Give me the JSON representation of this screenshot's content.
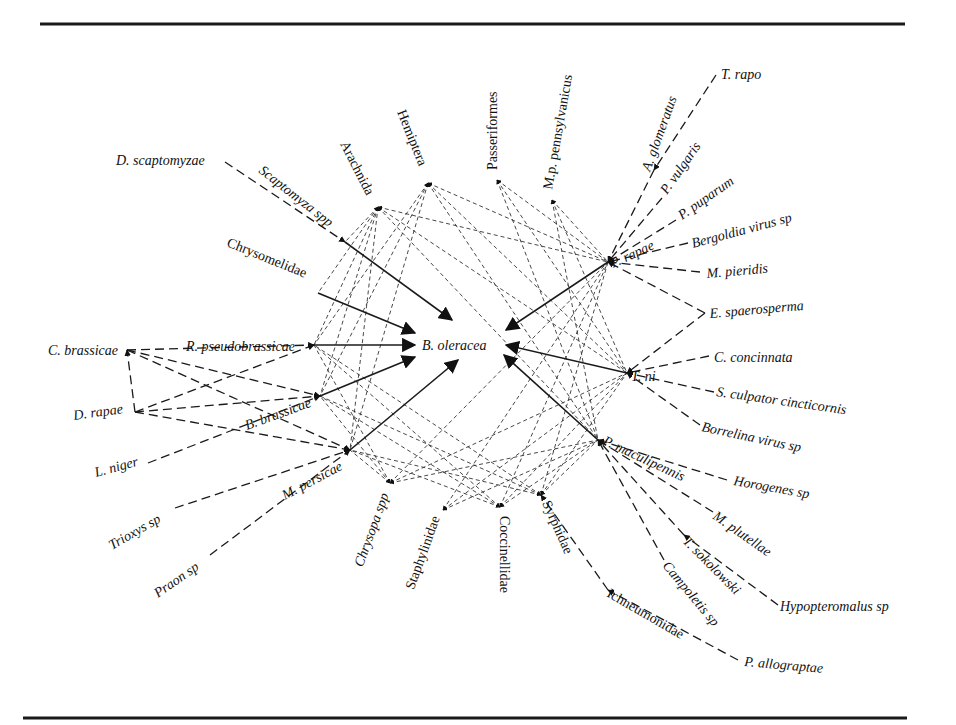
{
  "figure": {
    "center_node": "B. oleracea",
    "rules": {
      "top": {
        "x1": 40,
        "x2": 905,
        "y": 24
      },
      "bottom": {
        "x1": 23,
        "x2": 907,
        "y": 718
      }
    }
  },
  "nodes": [
    {
      "id": "boleracea",
      "label": "B. oleracea",
      "x": 450,
      "y": 345,
      "lx": 422,
      "ly": 350,
      "rot": 0,
      "italic": true,
      "anchor": "start"
    },
    {
      "id": "scapto",
      "label": "Scaptomyza spp",
      "x": 345,
      "y": 242,
      "lx": 258,
      "ly": 172,
      "rot": 38,
      "italic": true,
      "anchor": "start"
    },
    {
      "id": "chryso",
      "label": "Chrysomelidae",
      "x": 318,
      "y": 293,
      "lx": 226,
      "ly": 246,
      "rot": 22,
      "italic": false,
      "anchor": "start"
    },
    {
      "id": "rpseudo",
      "label": "R. pseudobrassicae",
      "x": 314,
      "y": 345,
      "lx": 186,
      "ly": 351,
      "rot": 0,
      "italic": true,
      "anchor": "start"
    },
    {
      "id": "bbrass",
      "label": "B. brassicae",
      "x": 320,
      "y": 396,
      "lx": 247,
      "ly": 430,
      "rot": -20,
      "italic": true,
      "anchor": "start"
    },
    {
      "id": "mpers",
      "label": "M. persicae",
      "x": 350,
      "y": 450,
      "lx": 285,
      "ly": 500,
      "rot": -28,
      "italic": true,
      "anchor": "start"
    },
    {
      "id": "prapae",
      "label": "P. rapae",
      "x": 608,
      "y": 262,
      "lx": 613,
      "ly": 268,
      "rot": -25,
      "italic": true,
      "anchor": "start"
    },
    {
      "id": "tni",
      "label": "T. ni",
      "x": 627,
      "y": 373,
      "lx": 631,
      "ly": 381,
      "rot": 0,
      "italic": true,
      "anchor": "start"
    },
    {
      "id": "pmacu",
      "label": "P. maculipennis",
      "x": 598,
      "y": 440,
      "lx": 602,
      "ly": 444,
      "rot": 25,
      "italic": true,
      "anchor": "start"
    },
    {
      "id": "arach",
      "label": "Arachnida",
      "x": 378,
      "y": 207,
      "lx": 340,
      "ly": 144,
      "rot": 63,
      "italic": false,
      "anchor": "start"
    },
    {
      "id": "hemip",
      "label": "Hemiptera",
      "x": 428,
      "y": 183,
      "lx": 397,
      "ly": 112,
      "rot": 68,
      "italic": false,
      "anchor": "start"
    },
    {
      "id": "passer",
      "label": "Passeriformes",
      "x": 497,
      "y": 180,
      "lx": 497,
      "ly": 170,
      "rot": -90,
      "italic": false,
      "anchor": "start"
    },
    {
      "id": "mpp",
      "label": "M.p. pennsylvanicus",
      "x": 552,
      "y": 200,
      "lx": 552,
      "ly": 190,
      "rot": -80,
      "italic": false,
      "anchor": "start"
    },
    {
      "id": "chrysopa",
      "label": "Chrysopa spp",
      "x": 390,
      "y": 483,
      "lx": 389,
      "ly": 495,
      "rot": -70,
      "italic": true,
      "anchor": "end"
    },
    {
      "id": "staph",
      "label": "Staphylinidae",
      "x": 443,
      "y": 510,
      "lx": 440,
      "ly": 518,
      "rot": -70,
      "italic": false,
      "anchor": "end"
    },
    {
      "id": "cocci",
      "label": "Coccinellidae",
      "x": 500,
      "y": 507,
      "lx": 500,
      "ly": 516,
      "rot": 90,
      "italic": false,
      "anchor": "start"
    },
    {
      "id": "syrph",
      "label": "Syrphidae",
      "x": 541,
      "y": 495,
      "lx": 542,
      "ly": 503,
      "rot": 66,
      "italic": false,
      "anchor": "start"
    },
    {
      "id": "dscapto",
      "label": "D. scaptomyzae",
      "x": 225,
      "y": 162,
      "lx": 116,
      "ly": 165,
      "rot": 0,
      "italic": true,
      "anchor": "start"
    },
    {
      "id": "cbrass",
      "label": "C. brassicae",
      "x": 127,
      "y": 350,
      "lx": 48,
      "ly": 355,
      "rot": 0,
      "italic": true,
      "anchor": "start"
    },
    {
      "id": "drapae",
      "label": "D. rapae",
      "x": 135,
      "y": 412,
      "lx": 74,
      "ly": 420,
      "rot": -8,
      "italic": true,
      "anchor": "start"
    },
    {
      "id": "lniger",
      "label": "L. niger",
      "x": 148,
      "y": 463,
      "lx": 96,
      "ly": 477,
      "rot": -15,
      "italic": true,
      "anchor": "start"
    },
    {
      "id": "trioxys",
      "label": "Trioxys sp",
      "x": 175,
      "y": 508,
      "lx": 112,
      "ly": 550,
      "rot": -30,
      "italic": true,
      "anchor": "start"
    },
    {
      "id": "praon",
      "label": "Praon sp",
      "x": 210,
      "y": 555,
      "lx": 158,
      "ly": 598,
      "rot": -35,
      "italic": true,
      "anchor": "start"
    },
    {
      "id": "aglom",
      "label": "A. glomeratus",
      "x": 654,
      "y": 170,
      "lx": 650,
      "ly": 172,
      "rot": -70,
      "italic": true,
      "anchor": "start"
    },
    {
      "id": "trapo",
      "label": "T. rapo",
      "x": 716,
      "y": 75,
      "lx": 721,
      "ly": 79,
      "rot": 0,
      "italic": true,
      "anchor": "start"
    },
    {
      "id": "pvulg",
      "label": "P. vulgaris",
      "x": 662,
      "y": 198,
      "lx": 667,
      "ly": 195,
      "rot": -55,
      "italic": true,
      "anchor": "start"
    },
    {
      "id": "ppup",
      "label": "P. puparum",
      "x": 676,
      "y": 220,
      "lx": 682,
      "ly": 220,
      "rot": -35,
      "italic": true,
      "anchor": "start"
    },
    {
      "id": "bergol",
      "label": "Bergoldia virus sp",
      "x": 688,
      "y": 243,
      "lx": 693,
      "ly": 248,
      "rot": -15,
      "italic": true,
      "anchor": "start"
    },
    {
      "id": "mpieri",
      "label": "M. pieridis",
      "x": 700,
      "y": 272,
      "lx": 707,
      "ly": 278,
      "rot": -5,
      "italic": true,
      "anchor": "start"
    },
    {
      "id": "espaer",
      "label": "E. spaerosperma",
      "x": 705,
      "y": 313,
      "lx": 710,
      "ly": 318,
      "rot": -5,
      "italic": true,
      "anchor": "start"
    },
    {
      "id": "cconc",
      "label": "C. concinnata",
      "x": 709,
      "y": 356,
      "lx": 714,
      "ly": 362,
      "rot": 0,
      "italic": true,
      "anchor": "start"
    },
    {
      "id": "sculp",
      "label": "S. culpator cincticornis",
      "x": 714,
      "y": 392,
      "lx": 716,
      "ly": 396,
      "rot": 8,
      "italic": true,
      "anchor": "start"
    },
    {
      "id": "borrel",
      "label": "Borrelina virus sp",
      "x": 700,
      "y": 425,
      "lx": 701,
      "ly": 431,
      "rot": 12,
      "italic": true,
      "anchor": "start"
    },
    {
      "id": "horog",
      "label": "Horogenes sp",
      "x": 727,
      "y": 480,
      "lx": 733,
      "ly": 485,
      "rot": 10,
      "italic": true,
      "anchor": "start"
    },
    {
      "id": "mplut",
      "label": "M. plutellae",
      "x": 713,
      "y": 512,
      "lx": 712,
      "ly": 518,
      "rot": 35,
      "italic": true,
      "anchor": "start"
    },
    {
      "id": "tsoko",
      "label": "T. sokolowski",
      "x": 684,
      "y": 535,
      "lx": 682,
      "ly": 542,
      "rot": 45,
      "italic": true,
      "anchor": "start"
    },
    {
      "id": "campo",
      "label": "Campoletis sp",
      "x": 664,
      "y": 560,
      "lx": 662,
      "ly": 566,
      "rot": 50,
      "italic": true,
      "anchor": "start"
    },
    {
      "id": "hypop",
      "label": "Hypopteromalus sp",
      "x": 778,
      "y": 605,
      "lx": 780,
      "ly": 611,
      "rot": 0,
      "italic": true,
      "anchor": "start"
    },
    {
      "id": "ichneu",
      "label": "Ichneumonidae",
      "x": 608,
      "y": 590,
      "lx": 606,
      "ly": 596,
      "rot": 30,
      "italic": false,
      "anchor": "start"
    },
    {
      "id": "pallo",
      "label": "P. allograptae",
      "x": 738,
      "y": 660,
      "lx": 744,
      "ly": 666,
      "rot": 5,
      "italic": true,
      "anchor": "start"
    }
  ],
  "edges": {
    "herbivory_solid": [
      {
        "from": [
          345,
          242
        ],
        "to": [
          452,
          320
        ]
      },
      {
        "from": [
          318,
          293
        ],
        "to": [
          415,
          333
        ]
      },
      {
        "from": [
          314,
          345
        ],
        "to": [
          415,
          345
        ]
      },
      {
        "from": [
          320,
          396
        ],
        "to": [
          415,
          357
        ]
      },
      {
        "from": [
          350,
          450
        ],
        "to": [
          458,
          360
        ]
      },
      {
        "from": [
          608,
          262
        ],
        "to": [
          506,
          330
        ]
      },
      {
        "from": [
          627,
          373
        ],
        "to": [
          506,
          345
        ]
      },
      {
        "from": [
          598,
          440
        ],
        "to": [
          504,
          355
        ]
      }
    ],
    "predation_web": [
      [
        "arach",
        "prapae"
      ],
      [
        "arach",
        "tni"
      ],
      [
        "arach",
        "pmacu"
      ],
      [
        "arach",
        "mpers"
      ],
      [
        "arach",
        "bbrass"
      ],
      [
        "arach",
        "rpseudo"
      ],
      [
        "arach",
        "chryso"
      ],
      [
        "arach",
        "scapto"
      ],
      [
        "hemip",
        "prapae"
      ],
      [
        "hemip",
        "tni"
      ],
      [
        "hemip",
        "pmacu"
      ],
      [
        "hemip",
        "mpers"
      ],
      [
        "hemip",
        "bbrass"
      ],
      [
        "hemip",
        "rpseudo"
      ],
      [
        "passer",
        "prapae"
      ],
      [
        "passer",
        "tni"
      ],
      [
        "passer",
        "pmacu"
      ],
      [
        "mpp",
        "prapae"
      ],
      [
        "mpp",
        "tni"
      ],
      [
        "mpp",
        "pmacu"
      ],
      [
        "chrysopa",
        "prapae"
      ],
      [
        "chrysopa",
        "tni"
      ],
      [
        "chrysopa",
        "pmacu"
      ],
      [
        "chrysopa",
        "mpers"
      ],
      [
        "chrysopa",
        "bbrass"
      ],
      [
        "chrysopa",
        "rpseudo"
      ],
      [
        "staph",
        "prapae"
      ],
      [
        "staph",
        "tni"
      ],
      [
        "staph",
        "pmacu"
      ],
      [
        "cocci",
        "mpers"
      ],
      [
        "cocci",
        "bbrass"
      ],
      [
        "cocci",
        "rpseudo"
      ],
      [
        "cocci",
        "prapae"
      ],
      [
        "cocci",
        "tni"
      ],
      [
        "cocci",
        "pmacu"
      ],
      [
        "syrph",
        "mpers"
      ],
      [
        "syrph",
        "bbrass"
      ],
      [
        "syrph",
        "rpseudo"
      ],
      [
        "syrph",
        "prapae"
      ],
      [
        "syrph",
        "tni"
      ],
      [
        "syrph",
        "pmacu"
      ]
    ],
    "parasitism_dashed": [
      [
        "dscapto",
        "scapto"
      ],
      [
        "cbrass",
        "rpseudo"
      ],
      [
        "cbrass",
        "bbrass"
      ],
      [
        "cbrass",
        "mpers"
      ],
      [
        "drapae",
        "rpseudo"
      ],
      [
        "drapae",
        "bbrass"
      ],
      [
        "drapae",
        "mpers"
      ],
      [
        "drapae",
        "cbrass"
      ],
      [
        "lniger",
        "bbrass"
      ],
      [
        "trioxys",
        "mpers"
      ],
      [
        "praon",
        "mpers"
      ],
      [
        "trapo",
        "aglom"
      ],
      [
        "aglom",
        "prapae"
      ],
      [
        "pvulg",
        "prapae"
      ],
      [
        "ppup",
        "prapae"
      ],
      [
        "bergol",
        "prapae"
      ],
      [
        "mpieri",
        "prapae"
      ],
      [
        "espaer",
        "prapae"
      ],
      [
        "espaer",
        "tni"
      ],
      [
        "cconc",
        "tni"
      ],
      [
        "sculp",
        "tni"
      ],
      [
        "borrel",
        "tni"
      ],
      [
        "horog",
        "pmacu"
      ],
      [
        "mplut",
        "pmacu"
      ],
      [
        "tsoko",
        "pmacu"
      ],
      [
        "campo",
        "pmacu"
      ],
      [
        "hypop",
        "tsoko"
      ],
      [
        "ichneu",
        "syrph"
      ],
      [
        "pallo",
        "ichneu"
      ]
    ]
  },
  "legend_colors": {
    "ink": "#111111",
    "paper": "#ffffff"
  }
}
